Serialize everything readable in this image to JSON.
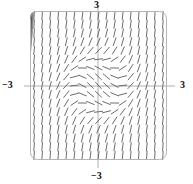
{
  "figure": {
    "kind": "slope-field",
    "title": "",
    "frame": {
      "x0": 30,
      "y0": 11,
      "x1": 167,
      "y1": 160,
      "corner_radius": 7,
      "stroke": "#b4b4b4"
    },
    "axes": {
      "x_axis_y_px": 86,
      "y_axis_x_px": 98,
      "stroke": "#9a9a9a"
    },
    "labels": {
      "top": "3",
      "bottom": "−3",
      "left": "−3",
      "right": "3"
    }
  },
  "chart_data": {
    "type": "line",
    "title": "",
    "subtitle": "",
    "xlabel": "",
    "ylabel": "",
    "xlim": [
      -3,
      3
    ],
    "ylim": [
      -3,
      3
    ],
    "xticks": [
      -3,
      3
    ],
    "yticks": [
      -3,
      3
    ],
    "xticklabels": [
      "−3",
      "3"
    ],
    "yticklabels": [
      "−3",
      "3"
    ],
    "grid": false,
    "legend": null,
    "annotations": [],
    "slope_field": {
      "description": "direction field of dy/dx = x^2 + y^2 - 1 drawn as short dashes on a 17x17 grid",
      "equation": "x*x + y*y - 1",
      "grid_nx": 17,
      "grid_ny": 17,
      "x_range": [
        -2.82,
        2.82
      ],
      "y_range": [
        -2.82,
        2.82
      ],
      "dash_length_px": 9,
      "dash_stroke": "#5c5c5c",
      "dash_width": 0.9
    },
    "series": [
      {
        "name": "solution-curve-1",
        "y0_at_x_minus3": 2.3,
        "stroke": "#1a1a1a",
        "width": 1.35
      },
      {
        "name": "solution-curve-2",
        "y0_at_x_minus3": 2.05,
        "stroke": "#333333",
        "width": 1.15
      },
      {
        "name": "solution-curve-3",
        "y0_at_x_minus3": 1.8,
        "stroke": "#4d4d4d",
        "width": 1.05
      },
      {
        "name": "solution-curve-4",
        "y0_at_x_minus3": 1.55,
        "stroke": "#5f5f5f",
        "width": 1.0
      },
      {
        "name": "solution-curve-5",
        "y0_at_x_minus3": 1.32,
        "stroke": "#767676",
        "width": 0.95
      },
      {
        "name": "separatrix",
        "y0_at_x_minus3": 1.12,
        "stroke": "#8a8a8a",
        "width": 0.95
      }
    ],
    "curve_style": "monotone S-shaped solutions rising steeply near x = -1.4 and x = +1.4, flattening through the origin"
  }
}
